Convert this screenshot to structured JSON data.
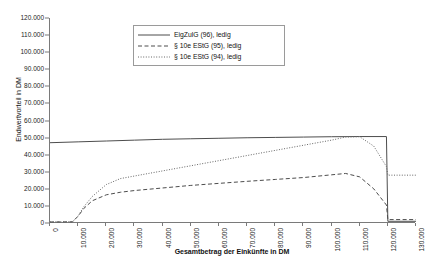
{
  "chart_data": {
    "type": "line",
    "title": "",
    "xlabel": "Gesamtbetrag der Einkünfte in DM",
    "ylabel": "Endwertvorteil in DM",
    "xlim": [
      0,
      130000
    ],
    "ylim": [
      0,
      120000
    ],
    "grid": false,
    "legend_position": "top-center",
    "x_ticks": [
      "0",
      "10.000",
      "20.000",
      "30.000",
      "40.000",
      "50.000",
      "60.000",
      "70.000",
      "80.000",
      "90.000",
      "100.000",
      "110.000",
      "120.000",
      "130.000"
    ],
    "x_tick_values": [
      0,
      10000,
      20000,
      30000,
      40000,
      50000,
      60000,
      70000,
      80000,
      90000,
      100000,
      110000,
      120000,
      130000
    ],
    "y_ticks": [
      "0",
      "10.000",
      "20.000",
      "30.000",
      "40.000",
      "50.000",
      "60.000",
      "70.000",
      "80.000",
      "90.000",
      "100.000",
      "110.000",
      "120.000"
    ],
    "y_tick_values": [
      0,
      10000,
      20000,
      30000,
      40000,
      50000,
      60000,
      70000,
      80000,
      90000,
      100000,
      110000,
      120000
    ],
    "series": [
      {
        "name": "EigZulG (96), ledig",
        "style": "solid",
        "color": "#4d4d4d",
        "x": [
          0,
          10000,
          20000,
          30000,
          40000,
          50000,
          60000,
          70000,
          80000,
          90000,
          100000,
          110000,
          119500,
          120000,
          130000
        ],
        "values": [
          47000,
          47500,
          48000,
          48500,
          49000,
          49300,
          49600,
          49900,
          50100,
          50300,
          50500,
          50600,
          50600,
          1000,
          1000
        ]
      },
      {
        "name": "§ 10e EStG (95), ledig",
        "style": "dashed",
        "color": "#4d4d4d",
        "x": [
          0,
          8000,
          10000,
          12000,
          15000,
          20000,
          25000,
          30000,
          40000,
          50000,
          60000,
          70000,
          80000,
          90000,
          100000,
          105000,
          110000,
          115000,
          119500,
          120000,
          130000
        ],
        "values": [
          600,
          700,
          4000,
          8500,
          13000,
          16500,
          18000,
          19000,
          20500,
          22000,
          23200,
          24400,
          25500,
          26600,
          28200,
          29000,
          27000,
          20000,
          10500,
          2000,
          2000
        ]
      },
      {
        "name": "§ 10e EStG (94), ledig",
        "style": "dotted",
        "color": "#666666",
        "x": [
          0,
          8000,
          10000,
          12000,
          15000,
          20000,
          25000,
          30000,
          35000,
          40000,
          50000,
          60000,
          70000,
          80000,
          90000,
          100000,
          105000,
          110000,
          115000,
          119500,
          120000,
          130000
        ],
        "values": [
          600,
          700,
          4200,
          9500,
          15500,
          22500,
          26000,
          27500,
          29000,
          30500,
          33500,
          36500,
          39500,
          42500,
          45500,
          48500,
          50300,
          50500,
          45000,
          33000,
          28000,
          28000
        ]
      }
    ]
  },
  "legend": {
    "entries": [
      {
        "label": "EigZulG (96), ledig"
      },
      {
        "label": "§ 10e EStG (95), ledig"
      },
      {
        "label": "§ 10e EStG (94), ledig"
      }
    ]
  }
}
